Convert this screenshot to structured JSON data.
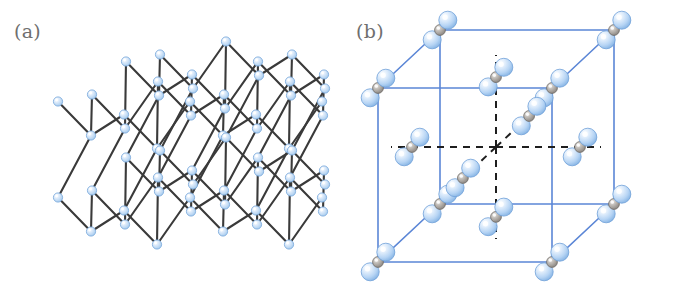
{
  "figure": {
    "width": 684,
    "height": 290,
    "background": "#ffffff",
    "type": "crystal-structure-illustration",
    "panel_count": 2
  },
  "panels": [
    {
      "id": "a",
      "label": "(a)",
      "label_color": "#6f6f6f",
      "structure_name": "layered puckered hexagonal lattice",
      "description": "Two stacked puckered honeycomb layers of identical atoms connected by vertical interlayer bonds",
      "atom_species": [
        {
          "name": "blue-atom",
          "color": "#aed1f2",
          "edge_color": "#7aa9dc",
          "highlight": "#ffffff",
          "radius": 4.6
        }
      ],
      "bond_color": "#3a3a3a",
      "bond_width": 2.1,
      "layer_count": 2,
      "hexagon_columns": 3,
      "hexagon_rows": 2,
      "geometry": {
        "cell_x": 66,
        "cell_y": 92,
        "skew_x": 34,
        "skew_y": -20,
        "pucker": 13,
        "origin_x": 58,
        "origin_y": 108,
        "layer_gap": 96,
        "sublayer_gap": 34
      }
    },
    {
      "id": "b",
      "label": "(b)",
      "label_color": "#6f6f6f",
      "structure_name": "cubic unit cell with oriented triatomic molecules",
      "description": "Blue-outlined cube; triatomic blue-gray-blue molecular units at the eight corners and six face-directions radiating from the cube centre along black dashed axes",
      "atom_species": [
        {
          "name": "blue-atom",
          "color": "#aed1f2",
          "edge_color": "#6f9fd8",
          "highlight": "#ffffff",
          "radius": 9.0
        },
        {
          "name": "gray-atom",
          "color": "#9a9590",
          "edge_color": "#6d6a66",
          "highlight": "#e8e6e2",
          "radius": 5.4
        }
      ],
      "cube_edge_color": "#5b86d6",
      "cube_edge_width": 1.6,
      "dashed_axis_color": "#1e1e1e",
      "dashed_axis_width": 2.0,
      "dash_pattern": "7 6",
      "corner_molecule_count": 8,
      "interior_molecule_count": 6,
      "geometry": {
        "front_left": 36,
        "front_top": 88,
        "front_size": 174,
        "depth_x": 62,
        "depth_y": -58,
        "center_x": 154,
        "center_y": 147
      }
    }
  ],
  "colors": {
    "background": "#ffffff",
    "blue_atom": "#aed1f2",
    "blue_atom_edge": "#7aa9dc",
    "gray_atom": "#9a9590",
    "gray_atom_edge": "#6d6a66",
    "bond_dark": "#3a3a3a",
    "cube_blue": "#5b86d6",
    "dashed_black": "#1e1e1e",
    "label_gray": "#6f6f6f"
  }
}
